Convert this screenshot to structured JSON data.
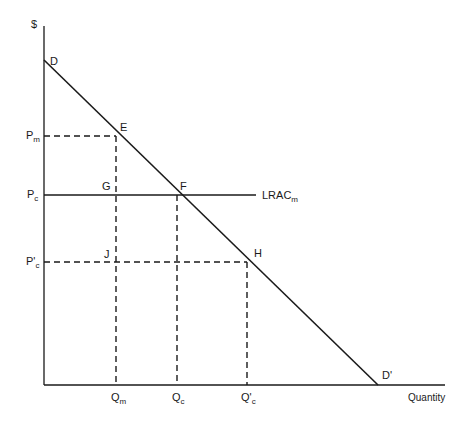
{
  "diagram": {
    "type": "economics-monopoly-vs-competition",
    "axes": {
      "y_label": "$",
      "x_label": "Quantity"
    },
    "curves": {
      "demand": {
        "start_label": "D",
        "end_label": "D'"
      },
      "lrac": {
        "label_main": "LRAC",
        "label_sub": "m"
      }
    },
    "points": {
      "E": "E",
      "F": "F",
      "G": "G",
      "H": "H",
      "J": "J"
    },
    "price_labels": {
      "pm": {
        "main": "P",
        "sub": "m"
      },
      "pc": {
        "main": "P",
        "sub": "c"
      },
      "pc_prime": {
        "main": "P'",
        "sub": "c"
      }
    },
    "quantity_labels": {
      "qm": {
        "main": "Q",
        "sub": "m"
      },
      "qc": {
        "main": "Q",
        "sub": "c"
      },
      "qc_prime": {
        "main": "Q'",
        "sub": "c"
      }
    },
    "colors": {
      "line": "#1a1a1a",
      "background": "#ffffff"
    }
  }
}
